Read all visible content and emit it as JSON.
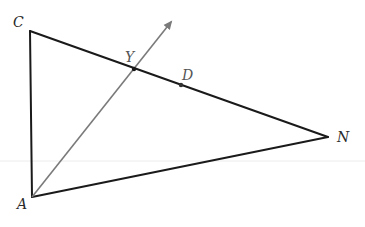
{
  "diagram": {
    "type": "geometry",
    "colors": {
      "sides": "#1a1a1a",
      "ray": "#7a7a7a",
      "labels": "#2a2a2a"
    },
    "vertices": {
      "C": {
        "label": "C",
        "x": 30,
        "y": 31
      },
      "A": {
        "label": "A",
        "x": 32,
        "y": 197
      },
      "N": {
        "label": "N",
        "x": 328,
        "y": 137
      }
    },
    "points": {
      "Y": {
        "label": "Y",
        "x": 134,
        "y": 69,
        "on": "CN"
      },
      "D": {
        "label": "D",
        "x": 181,
        "y": 85,
        "on": "CN"
      }
    },
    "segments": [
      {
        "from": "C",
        "to": "A"
      },
      {
        "from": "C",
        "to": "N"
      },
      {
        "from": "A",
        "to": "N"
      }
    ],
    "rays": [
      {
        "from": "A",
        "through": "Y",
        "arrow_tip": {
          "x": 173,
          "y": 19
        }
      }
    ],
    "labels": {
      "C": "C",
      "A": "A",
      "N": "N",
      "Y": "Y",
      "D": "D"
    }
  }
}
